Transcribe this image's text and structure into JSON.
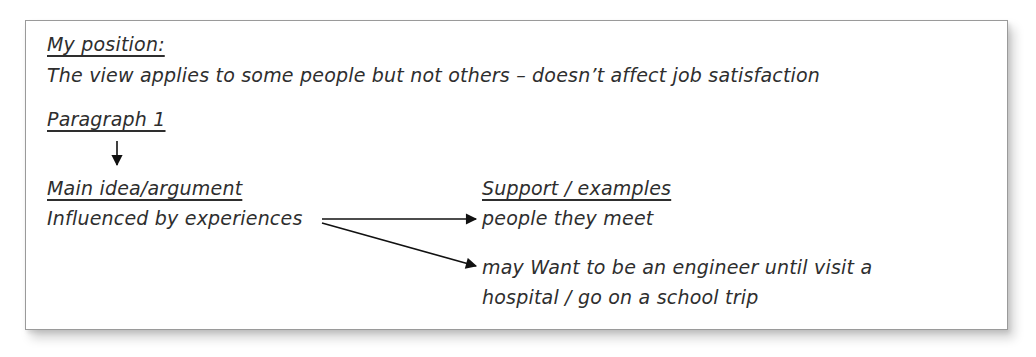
{
  "position": {
    "heading": "My position:",
    "statement": "The view applies to some people but not others – doesn’t affect job satisfaction"
  },
  "paragraph": {
    "heading": "Paragraph 1"
  },
  "main_idea": {
    "heading": "Main idea/argument",
    "text": "Influenced by experiences"
  },
  "support": {
    "heading": "Support / examples",
    "items": [
      {
        "text": "people they meet"
      },
      {
        "line1": "may Want to be an engineer until visit a",
        "line2": "hospital / go on a school trip"
      }
    ]
  },
  "colors": {
    "text": "#2e2e2e",
    "border": "#9a9a9a",
    "arrow": "#111111"
  }
}
